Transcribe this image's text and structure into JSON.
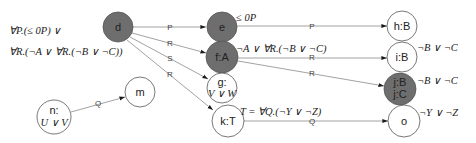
{
  "colors": {
    "filled_node": "#6e6e6e",
    "empty_node": "#ffffff",
    "node_stroke": "#555555",
    "edge": "#8a8a8a",
    "arrow": "#1a1a1a"
  },
  "annotations": {
    "d_line1": "∀P.(≤ 0P) ∨",
    "d_line2": "∀R.(¬A ∨ ∀R.(¬B ∨ ¬C))",
    "e": "≤ 0P",
    "f": "¬A ∨ ∀R.(¬B ∨ ¬C)",
    "k": "T = ∀Q.(¬Y ∨ ¬Z)",
    "i": "¬B ∨ ¬C",
    "j": "¬B ∨ ¬C",
    "o": "¬Y ∨ ¬Z"
  },
  "nodes": {
    "d": {
      "label": "d",
      "filled": true
    },
    "e": {
      "label": "e",
      "filled": true
    },
    "f": {
      "label": "f:A",
      "filled": true
    },
    "g": {
      "line1": "g:",
      "line2": "V ∨ W",
      "filled": false
    },
    "k": {
      "label": "k:T",
      "filled": false
    },
    "m": {
      "label": "m",
      "filled": false
    },
    "n": {
      "line1": "n:",
      "line2": "U ∨ V",
      "filled": false
    },
    "h": {
      "label": "h:B",
      "filled": false
    },
    "i": {
      "label": "i:B",
      "filled": false
    },
    "j": {
      "line1": "j:B",
      "line2": "j:C",
      "filled": true
    },
    "o": {
      "label": "o",
      "filled": false
    }
  },
  "edges": {
    "d_e": "P",
    "d_f": "R",
    "d_g": "S",
    "d_k": "R",
    "e_h": "P",
    "f_i": "R",
    "f_j": "R",
    "k_o": "Q",
    "n_m": "Q"
  }
}
